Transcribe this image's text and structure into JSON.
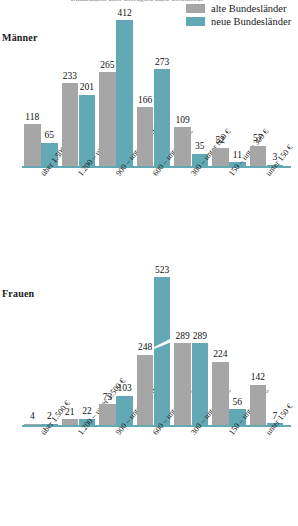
{
  "title": "Einkommen aller Befragten nach Geschlecht",
  "legend": {
    "items": [
      {
        "key": "alt",
        "label": "alte Bundesländer",
        "color": "#a6a6a6"
      },
      {
        "key": "neu",
        "label": "neue Bundesländer",
        "color": "#62a9b5"
      }
    ]
  },
  "sections": [
    {
      "key": "maenner",
      "label": "Männer"
    },
    {
      "key": "frauen",
      "label": "Frauen"
    }
  ],
  "chart_data": [
    {
      "type": "bar",
      "title": "Männer",
      "xlabel": "",
      "ylabel": "",
      "grid": false,
      "legend_position": "top-right",
      "categories": [
        "über 1.500 €",
        "1.200 – unter 1.500 €",
        "900 – unter 1.200 €",
        "600 – unter 900 €",
        "300 – unter 600 €",
        "150 – unter 300 €",
        "unter 150 €"
      ],
      "series": [
        {
          "name": "alte Bundesländer",
          "color": "#a6a6a6",
          "values": [
            118,
            233,
            265,
            166,
            109,
            52,
            57
          ]
        },
        {
          "name": "neue Bundesländer",
          "color": "#62a9b5",
          "values": [
            65,
            201,
            412,
            273,
            35,
            11,
            3
          ]
        }
      ],
      "ylim": [
        0,
        412
      ],
      "axis_break": false
    },
    {
      "type": "bar",
      "title": "Frauen",
      "xlabel": "",
      "ylabel": "",
      "grid": false,
      "legend_position": "top-right",
      "categories": [
        "über 1.500 €",
        "1.200 – unter 1.500 €",
        "900 – unter 1.200 €",
        "600 – unter 900 €",
        "300 – unter 600 €",
        "150 – unter 300 €",
        "unter 150 €"
      ],
      "series": [
        {
          "name": "alte Bundesländer",
          "color": "#a6a6a6",
          "values": [
            4,
            21,
            73,
            248,
            289,
            224,
            142
          ]
        },
        {
          "name": "neue Bundesländer",
          "color": "#62a9b5",
          "values": [
            2,
            22,
            103,
            523,
            289,
            56,
            7
          ]
        }
      ],
      "ylim": [
        0,
        523
      ],
      "axis_break": true,
      "axis_break_note": "523"
    }
  ]
}
